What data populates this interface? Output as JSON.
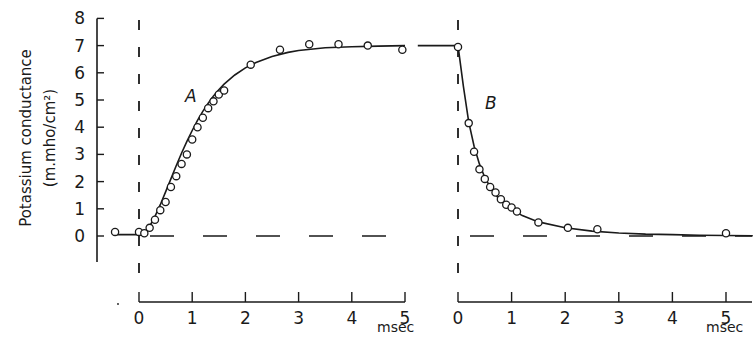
{
  "chart_data": {
    "type": "line",
    "title": "",
    "ylabel": "Potassium conductance",
    "ylabel_units": "(m.mho/cm²)",
    "ylim": [
      -1.0,
      8
    ],
    "yticks": [
      "0",
      "1",
      "2",
      "3",
      "4",
      "5",
      "6",
      "7",
      "8"
    ],
    "grid": false,
    "legend": null,
    "panels": [
      {
        "name": "A",
        "label": "A",
        "description": "Rise of potassium conductance after depolarization",
        "xlabel": "msec",
        "xticks": [
          "0",
          "1",
          "2",
          "3",
          "4",
          "5"
        ],
        "xlim": [
          -0.45,
          5.0
        ],
        "fitted_curve": {
          "x": [
            -0.45,
            0.0,
            0.1,
            0.2,
            0.3,
            0.4,
            0.5,
            0.6,
            0.7,
            0.8,
            0.9,
            1.0,
            1.1,
            1.2,
            1.3,
            1.4,
            1.5,
            1.6,
            1.8,
            2.0,
            2.2,
            2.5,
            2.8,
            3.0,
            3.5,
            4.0,
            4.5,
            5.0
          ],
          "y": [
            0.05,
            0.05,
            0.12,
            0.35,
            0.72,
            1.15,
            1.62,
            2.1,
            2.58,
            3.05,
            3.48,
            3.88,
            4.25,
            4.58,
            4.88,
            5.15,
            5.38,
            5.58,
            5.92,
            6.18,
            6.38,
            6.6,
            6.75,
            6.82,
            6.92,
            6.96,
            6.98,
            7.0
          ]
        },
        "points": {
          "x": [
            -0.45,
            0.0,
            0.1,
            0.2,
            0.3,
            0.4,
            0.5,
            0.6,
            0.7,
            0.8,
            0.9,
            1.0,
            1.1,
            1.2,
            1.3,
            1.4,
            1.5,
            1.6,
            2.1,
            2.65,
            3.2,
            3.75,
            4.3,
            4.95
          ],
          "y": [
            0.15,
            0.15,
            0.1,
            0.3,
            0.6,
            0.95,
            1.25,
            1.8,
            2.2,
            2.65,
            3.0,
            3.55,
            4.0,
            4.35,
            4.7,
            4.95,
            5.2,
            5.35,
            6.3,
            6.85,
            7.05,
            7.05,
            7.0,
            6.85
          ]
        }
      },
      {
        "name": "B",
        "label": "B",
        "description": "Decline of potassium conductance after repolarization",
        "xlabel": "msec",
        "xticks": [
          "0",
          "1",
          "2",
          "3",
          "4",
          "5"
        ],
        "xlim": [
          -0.75,
          5.5
        ],
        "fitted_curve": {
          "x": [
            -0.75,
            0.0,
            0.1,
            0.2,
            0.3,
            0.4,
            0.5,
            0.6,
            0.7,
            0.8,
            0.9,
            1.0,
            1.2,
            1.5,
            2.0,
            2.5,
            3.0,
            3.5,
            4.0,
            4.5,
            5.0,
            5.5
          ],
          "y": [
            7.0,
            7.0,
            5.5,
            4.2,
            3.3,
            2.65,
            2.15,
            1.8,
            1.52,
            1.3,
            1.12,
            0.98,
            0.75,
            0.52,
            0.3,
            0.18,
            0.11,
            0.07,
            0.05,
            0.03,
            0.02,
            0.01
          ]
        },
        "points": {
          "x": [
            0.0,
            0.2,
            0.3,
            0.4,
            0.5,
            0.6,
            0.7,
            0.8,
            0.9,
            1.0,
            1.1,
            1.5,
            2.05,
            2.6,
            5.0
          ],
          "y": [
            6.95,
            4.15,
            3.1,
            2.45,
            2.1,
            1.8,
            1.6,
            1.35,
            1.15,
            1.05,
            0.9,
            0.5,
            0.3,
            0.25,
            0.1
          ]
        }
      }
    ]
  },
  "labels": {
    "ylabel_line1": "Potassium conductance",
    "ylabel_line2": "(m.mho/cm²)",
    "panel_a": "A",
    "panel_b": "B",
    "xunit_a": "msec",
    "xunit_b": "msec"
  },
  "colors": {
    "ink": "#1a1a1a",
    "background": "#ffffff"
  }
}
